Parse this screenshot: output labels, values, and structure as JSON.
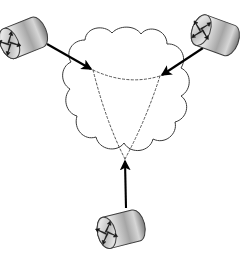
{
  "diagram": {
    "title": "Network topology with three routers attached to a service provider cloud",
    "type": "network-topology",
    "canvas": {
      "width": 249,
      "height": 278,
      "background": "#ffffff"
    },
    "colors": {
      "stroke": "#000000",
      "cloud_outline": "#3a3a3a",
      "dashed_link": "#555555",
      "router_body_light": "#f2f2f2",
      "router_body_mid": "#b9b9b9",
      "router_body_dark": "#6e6e6e",
      "router_edge": "#3d3d3d",
      "router_glyph": "#1a1a1a"
    },
    "cloud": {
      "name": "network-cloud",
      "label": "",
      "center_x": 127,
      "center_y": 99,
      "bounds": {
        "x": 68,
        "y": 31,
        "width": 119,
        "height": 135
      },
      "outline_width": 1,
      "fill": "#ffffff",
      "bump_count": 10
    },
    "routers": [
      {
        "id": "router-top-left",
        "label": "",
        "cx": 28,
        "cy": 36,
        "rx": 22,
        "ry": 19,
        "rotation": -22
      },
      {
        "id": "router-top-right",
        "label": "",
        "cx": 220,
        "cy": 37,
        "rx": 22,
        "ry": 19,
        "rotation": 20
      },
      {
        "id": "router-bottom",
        "label": "",
        "cx": 126,
        "cy": 228,
        "rx": 22,
        "ry": 19,
        "rotation": -14
      }
    ],
    "cloud_nodes": [
      {
        "id": "cloud-node-left",
        "x": 93,
        "y": 70
      },
      {
        "id": "cloud-node-right",
        "x": 160,
        "y": 76
      },
      {
        "id": "cloud-node-bottom",
        "x": 125,
        "y": 159
      }
    ],
    "access_links": [
      {
        "id": "link-top-left",
        "from": "router-top-left",
        "to": "cloud-node-left",
        "style": "solid",
        "arrow": "end",
        "x1": 47,
        "y1": 44,
        "x2": 93,
        "y2": 70
      },
      {
        "id": "link-top-right",
        "from": "router-top-right",
        "to": "cloud-node-right",
        "style": "solid",
        "arrow": "end",
        "x1": 203,
        "y1": 48,
        "x2": 160,
        "y2": 76
      },
      {
        "id": "link-bottom",
        "from": "router-bottom",
        "to": "cloud-node-bottom",
        "style": "solid",
        "arrow": "end",
        "x1": 126,
        "y1": 208,
        "x2": 125,
        "y2": 159
      }
    ],
    "virtual_circuits": [
      {
        "id": "vc-left-right",
        "from": "cloud-node-left",
        "to": "cloud-node-right",
        "style": "dashed",
        "path": "M 93 70 Q 127 86 160 76"
      },
      {
        "id": "vc-left-bottom",
        "from": "cloud-node-left",
        "to": "cloud-node-bottom",
        "style": "dashed",
        "path": "M 93 70 Q 106 122 125 159"
      },
      {
        "id": "vc-right-bottom",
        "from": "cloud-node-right",
        "to": "cloud-node-bottom",
        "style": "dashed",
        "path": "M 160 76 Q 146 120 125 159"
      }
    ]
  }
}
